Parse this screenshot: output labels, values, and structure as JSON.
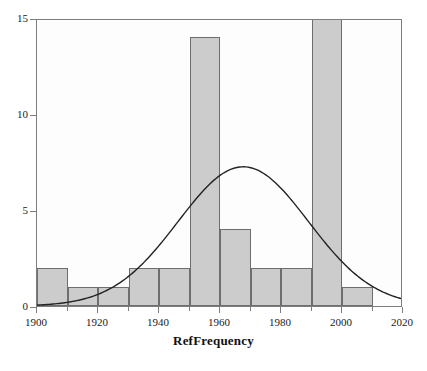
{
  "chart_data": {
    "type": "bar",
    "title": "",
    "subtitle": "",
    "xlabel": "RefFrequency",
    "ylabel": "",
    "xlim": [
      1900,
      2020
    ],
    "ylim": [
      0,
      15
    ],
    "grid": false,
    "legend": "none",
    "bin_width": 10,
    "categories": [
      "1900-1910",
      "1910-1920",
      "1920-1930",
      "1930-1940",
      "1940-1950",
      "1950-1960",
      "1960-1970",
      "1970-1980",
      "1980-1990",
      "1990-2000",
      "2000-2010",
      "2010-2020"
    ],
    "bin_starts": [
      1900,
      1910,
      1920,
      1930,
      1940,
      1950,
      1960,
      1970,
      1980,
      1990,
      2000,
      2010
    ],
    "values": [
      2,
      1,
      1,
      2,
      2,
      14,
      4,
      2,
      2,
      15,
      1,
      0
    ],
    "values_note": "1990-2000 bar is clipped at the top of the axis (>= 15)",
    "xticks": [
      1900,
      1920,
      1940,
      1960,
      1980,
      2000,
      2020
    ],
    "xticklabels": [
      "1900",
      "1920",
      "1940",
      "1960",
      "1980",
      "2000",
      "2020"
    ],
    "yticks": [
      0,
      5,
      10,
      15
    ],
    "yticklabels": [
      "0",
      "5",
      "10",
      "15"
    ],
    "overlay": {
      "type": "line",
      "name": "normal-density-curve",
      "mean": 1968,
      "peak_value": 7.3,
      "sigma": 21.5,
      "amplitude": 7.3,
      "endpoints": [
        {
          "x": 1900,
          "y": 0.3
        },
        {
          "x": 2020,
          "y": 1.0
        }
      ]
    },
    "colors": {
      "bar_fill": "#cccccc",
      "bar_edge": "#6e6e6e",
      "curve": "#232323",
      "axis": "#7d7d7d",
      "text": "#1a1a1a",
      "background": "#ffffff",
      "plot_background": "#fdfdfd"
    }
  }
}
